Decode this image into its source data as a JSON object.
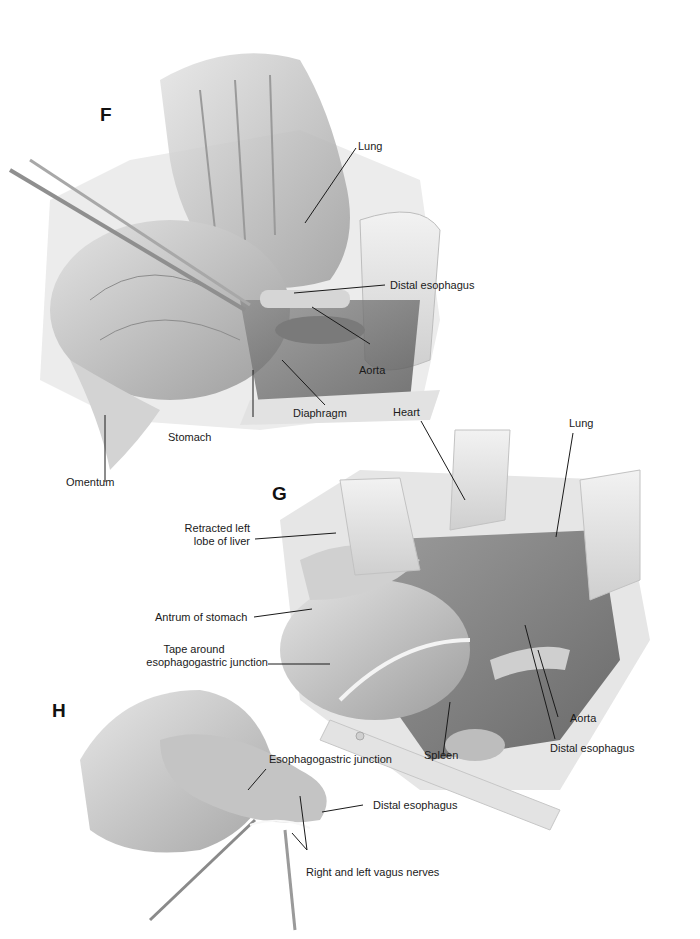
{
  "figure": {
    "panels": [
      {
        "id": "F",
        "letter": "F",
        "labels": {
          "lung": "Lung",
          "distal_esophagus": "Distal esophagus",
          "aorta": "Aorta",
          "diaphragm": "Diaphragm",
          "stomach": "Stomach",
          "omentum": "Omentum"
        }
      },
      {
        "id": "G",
        "letter": "G",
        "labels": {
          "heart": "Heart",
          "lung": "Lung",
          "retracted_liver_line1": "Retracted left",
          "retracted_liver_line2": "lobe of liver",
          "antrum": "Antrum of stomach",
          "tape_line1": "Tape around",
          "tape_line2": "esophagogastric junction",
          "spleen": "Spleen",
          "aorta": "Aorta",
          "distal_esophagus": "Distal esophagus"
        }
      },
      {
        "id": "H",
        "letter": "H",
        "labels": {
          "eg_junction": "Esophagogastric junction",
          "distal_esophagus": "Distal esophagus",
          "vagus_nerves": "Right and left vagus nerves"
        }
      }
    ]
  },
  "colors": {
    "background": "#ffffff",
    "tissue_light": "#d9d9d9",
    "tissue_mid": "#b5b5b5",
    "tissue_dark": "#6e6e6e",
    "retractor": "#e6e6e6",
    "leader_line": "#1a1a1a"
  }
}
